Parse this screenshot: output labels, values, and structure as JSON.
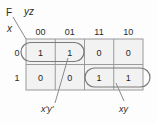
{
  "diagram": {
    "type": "karnaugh-map",
    "function_label": "F",
    "column_variable_label": "yz",
    "row_variable_label": "x",
    "column_headers": [
      "00",
      "01",
      "11",
      "10"
    ],
    "row_headers": [
      "0",
      "1"
    ],
    "cells": [
      {
        "row": "0",
        "col": "00",
        "value": "1"
      },
      {
        "row": "0",
        "col": "01",
        "value": "1"
      },
      {
        "row": "0",
        "col": "11",
        "value": "0"
      },
      {
        "row": "0",
        "col": "10",
        "value": "0"
      },
      {
        "row": "1",
        "col": "00",
        "value": "0"
      },
      {
        "row": "1",
        "col": "01",
        "value": "0"
      },
      {
        "row": "1",
        "col": "11",
        "value": "1"
      },
      {
        "row": "1",
        "col": "10",
        "value": "1"
      }
    ],
    "groups": [
      {
        "label": "x'y'",
        "row": "0",
        "columns": [
          "00",
          "01"
        ]
      },
      {
        "label": "xy",
        "row": "1",
        "columns": [
          "11",
          "10"
        ]
      }
    ],
    "colors": {
      "grid_line": "#9a9a9a",
      "group_outline": "#7a7a7a",
      "leader_line": "#8a8a8a",
      "text": "#2b2b2b",
      "background": "#fdfdfd",
      "cell_fill": "#f2f2f2"
    }
  }
}
